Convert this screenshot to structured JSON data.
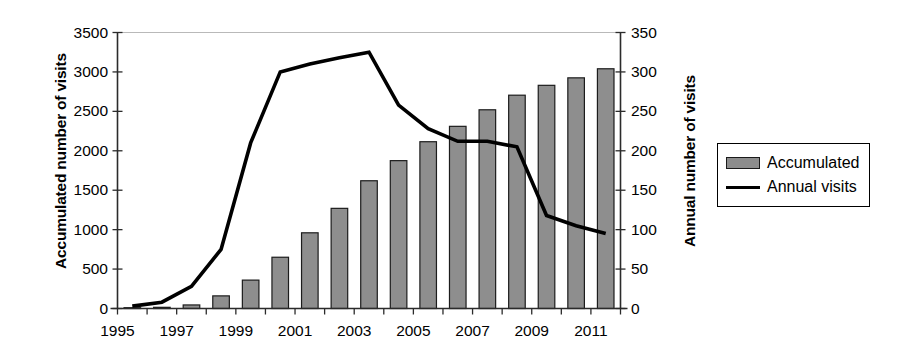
{
  "chart_data": {
    "type": "bar",
    "title": "",
    "subtitle": "",
    "xlabel": "",
    "ylabel": "Accumulated number of visits",
    "y2label": "Annual number of visits",
    "grid": false,
    "legend_position": "right",
    "x": [
      1995,
      1996,
      1997,
      1998,
      1999,
      2000,
      2001,
      2002,
      2003,
      2004,
      2005,
      2006,
      2007,
      2008,
      2009,
      2010,
      2011
    ],
    "xtick_labels": [
      "1995",
      "1997",
      "1999",
      "2001",
      "2003",
      "2005",
      "2007",
      "2009",
      "2011"
    ],
    "xtick_values": [
      1995,
      1997,
      1999,
      2001,
      2003,
      2005,
      2007,
      2009,
      2011
    ],
    "ylim": [
      0,
      3500
    ],
    "ytick_labels": [
      "0",
      "500",
      "1000",
      "1500",
      "2000",
      "2500",
      "3000",
      "3500"
    ],
    "ytick_values": [
      0,
      500,
      1000,
      1500,
      2000,
      2500,
      3000,
      3500
    ],
    "y2lim": [
      0,
      350
    ],
    "y2tick_labels": [
      "0",
      "50",
      "100",
      "150",
      "200",
      "250",
      "300",
      "350"
    ],
    "y2tick_values": [
      0,
      50,
      100,
      150,
      200,
      250,
      300,
      350
    ],
    "series": [
      {
        "name": "Accumulated",
        "type": "bar",
        "axis": "left",
        "color": "#8e8e8e",
        "edge_color": "#1c1c1c",
        "values": [
          5,
          15,
          45,
          160,
          360,
          650,
          960,
          1270,
          1620,
          1875,
          2115,
          2310,
          2520,
          2705,
          2830,
          2925,
          3040
        ]
      },
      {
        "name": "Annual visits",
        "type": "line",
        "axis": "right",
        "color": "#000000",
        "values": [
          3,
          8,
          28,
          75,
          210,
          300,
          310,
          318,
          325,
          258,
          228,
          212,
          212,
          205,
          118,
          105,
          95
        ]
      }
    ],
    "legend_entries": [
      "Accumulated",
      "Annual visits"
    ]
  },
  "legend": {
    "accumulated_label": "Accumulated",
    "annual_label": "Annual visits"
  },
  "axes": {
    "left_title": "Accumulated number of visits",
    "right_title": "Annual number of visits"
  }
}
